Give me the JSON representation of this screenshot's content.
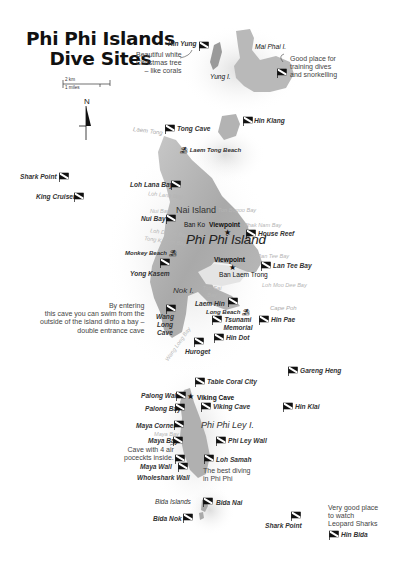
{
  "title": {
    "line1": "Phi Phi Islands",
    "line2": "Dive Sites"
  },
  "scale": {
    "km": "2 km",
    "miles": "1 miles"
  },
  "compass": {
    "label": "N"
  },
  "islands": {
    "main": "Phi Phi Island",
    "nai": "Nai Island",
    "ley": "Phi Phi Ley I.",
    "mai_phai": "Mai Phai I.",
    "yung": "Yung I.",
    "nok": "Nok I.",
    "bida": "Bida Islands"
  },
  "places": {
    "ban_ko": "Ban Ko",
    "viewpoint1": "Viewpoint",
    "viewpoint2": "Viewpoint",
    "ban_laem_trong": "Ban Laem Trong",
    "laem_tong": "Laem Tong",
    "cape_poh": "Cape Poh",
    "viking_cave_place": "Viking Cave"
  },
  "bays": {
    "loh_lana": "Loh Lana Bay",
    "nui": "Nui Bay",
    "loh_dalum": "Loh Dalum Bay",
    "tong_kasem": "Tong Kasem Bay",
    "ran_tee": "Ran Tee Bay",
    "loh_moo_dee": "Loh Moo Dee Bay",
    "ton_sai": "Ton Sai Bay",
    "wang_long": "Wang Long Bay",
    "phak_nam": "Phak Nam Bay",
    "bon_bogoo": "Ton Bogoo Bay",
    "maya": "Maya Bay"
  },
  "beaches": {
    "laem_tong": "Laem Tong Beach",
    "monkey": "Monkey Beach",
    "long": "Long Beach"
  },
  "dive_sites": [
    {
      "id": "hin-yung",
      "name": "Hin Yung"
    },
    {
      "id": "tong-cave",
      "name": "Tong Cave"
    },
    {
      "id": "hin-klang",
      "name": "Hin Klang"
    },
    {
      "id": "shark-point-north",
      "name": "Shark Point"
    },
    {
      "id": "king-cruiser",
      "name": "King Cruiser"
    },
    {
      "id": "loh-lana-bay",
      "name": "Loh Lana Bay"
    },
    {
      "id": "nui-bay",
      "name": "Nui Bay"
    },
    {
      "id": "house-reef",
      "name": "House Reef"
    },
    {
      "id": "yong-kasem",
      "name": "Yong Kasem"
    },
    {
      "id": "lan-tee-bay",
      "name": "Lan Tee Bay"
    },
    {
      "id": "laem-hin",
      "name": "Laem Hin"
    },
    {
      "id": "tsunami-memorial",
      "name": "Tsunami Memorial"
    },
    {
      "id": "hin-pae",
      "name": "Hin Pae"
    },
    {
      "id": "wang-long-cave",
      "name": "Wang Long Cave"
    },
    {
      "id": "hin-dot",
      "name": "Hin Dot"
    },
    {
      "id": "huroget",
      "name": "Huroget"
    },
    {
      "id": "gareng-heng",
      "name": "Gareng Heng"
    },
    {
      "id": "table-coral-city",
      "name": "Table Coral City"
    },
    {
      "id": "palong-wall",
      "name": "Palong Wall"
    },
    {
      "id": "viking-cave",
      "name": "Viking Cave"
    },
    {
      "id": "palong-bay",
      "name": "Palong Bay"
    },
    {
      "id": "hin-klai",
      "name": "Hin Klai"
    },
    {
      "id": "maya-corner",
      "name": "Maya Corner"
    },
    {
      "id": "maya-bay",
      "name": "Maya Bay"
    },
    {
      "id": "phi-ley-wall",
      "name": "Phi Ley Wall"
    },
    {
      "id": "loh-samah",
      "name": "Loh Samah"
    },
    {
      "id": "maya-wall",
      "name": "Maya Wall"
    },
    {
      "id": "wholeshark-wall",
      "name": "Wholeshark Wall"
    },
    {
      "id": "bida-nai",
      "name": "Bida Nai"
    },
    {
      "id": "bida-nok",
      "name": "Bida Nok"
    },
    {
      "id": "shark-point-south",
      "name": "Shark Point"
    },
    {
      "id": "hin-bida",
      "name": "Hin Bida"
    }
  ],
  "notes": {
    "hin_yung": [
      "Beautiful white",
      "Christmas tree",
      "– like corals"
    ],
    "mai_phai": [
      "Good place for",
      "training dives",
      "and snorkelling"
    ],
    "wang_long": [
      "By entering",
      "this cave you can swim from the",
      "outside of the island dinto a bay –",
      "double entrance cave"
    ],
    "maya_bay": [
      "Cave with 4 air",
      "poceckts inside."
    ],
    "loh_samah": [
      "The best diving",
      "in Phi Phi"
    ],
    "hin_bida": [
      "Very good place",
      "to watch",
      "Leopard Sharks"
    ]
  },
  "colors": {
    "land": "#b8b8b8",
    "land_dark": "#8a8a8a",
    "shadow": "#e6e6e6",
    "text": "#333333",
    "flag": "#111111"
  }
}
